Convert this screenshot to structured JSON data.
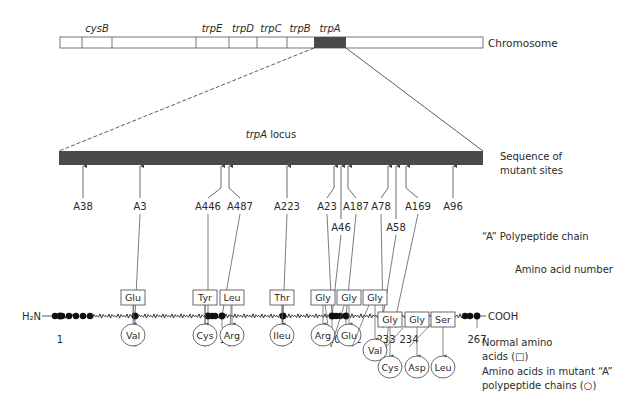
{
  "chromosome": {
    "label": "Chromosome",
    "genes": [
      {
        "name": "cysB",
        "x": 97
      },
      {
        "name": "trpE",
        "x": 212
      },
      {
        "name": "trpD",
        "x": 243
      },
      {
        "name": "trpC",
        "x": 271
      },
      {
        "name": "trpB",
        "x": 300
      },
      {
        "name": "trpA",
        "x": 330
      }
    ],
    "dividers": [
      82,
      112,
      196,
      229,
      257,
      287
    ],
    "bar": {
      "x1": 60,
      "x2": 483,
      "y": 37,
      "h": 11
    },
    "trpA_segment": {
      "x1": 314,
      "x2": 346
    },
    "dark_color": "#4a4a4a"
  },
  "locus": {
    "title_italic": "trpA",
    "title_rest": " locus",
    "bar": {
      "x1": 59,
      "x2": 483,
      "y": 151,
      "h": 14
    }
  },
  "mutant_sites_label": [
    "Sequence of",
    "mutant sites"
  ],
  "mutant_sites": [
    {
      "name": "A38",
      "arrow_x": 83,
      "label_x": 83,
      "label_y": 210,
      "to_chain": null
    },
    {
      "name": "A3",
      "arrow_x": 140,
      "label_x": 140,
      "label_y": 210,
      "to_chain": 48
    },
    {
      "name": "A446",
      "arrow_x": 221,
      "label_x": 208,
      "label_y": 210,
      "to_chain": 174,
      "bent": true
    },
    {
      "name": "A487",
      "arrow_x": 229,
      "label_x": 240,
      "label_y": 210,
      "to_chain": 176,
      "bent": true
    },
    {
      "name": "A223",
      "arrow_x": 287,
      "label_x": 287,
      "label_y": 210,
      "to_chain": 182
    },
    {
      "name": "A23",
      "arrow_x": 334,
      "label_x": 327,
      "label_y": 210,
      "to_chain": 210,
      "bent": true
    },
    {
      "name": "A46",
      "arrow_x": 341,
      "label_x": 341,
      "label_y": 231,
      "to_chain": 210
    },
    {
      "name": "A187",
      "arrow_x": 348,
      "label_x": 356,
      "label_y": 210,
      "to_chain": 212,
      "bent": true
    },
    {
      "name": "A78",
      "arrow_x": 388,
      "label_x": 381,
      "label_y": 210,
      "to_chain": 233,
      "bent": true
    },
    {
      "name": "A58",
      "arrow_x": 396,
      "label_x": 396,
      "label_y": 231,
      "to_chain": 233
    },
    {
      "name": "A169",
      "arrow_x": 406,
      "label_x": 418,
      "label_y": 210,
      "to_chain": 234,
      "bent": true
    },
    {
      "name": "A96",
      "arrow_x": 453,
      "label_x": 453,
      "label_y": 210,
      "to_chain": null
    }
  ],
  "chain": {
    "title": "“A” Polypeptide chain",
    "n_term": "H₂N",
    "c_term": "COOH",
    "y": 316,
    "x1": 55,
    "x2": 478,
    "axis_label": "Amino acid number",
    "positions": [
      {
        "num": "1",
        "x": 60,
        "label_x": 60
      },
      {
        "num": "48",
        "x": 135,
        "label_x": 135
      },
      {
        "num": "174",
        "x": 208,
        "label_x": 205
      },
      {
        "num": "176",
        "x": 222,
        "label_x": 229
      },
      {
        "num": "182",
        "x": 283,
        "label_x": 283
      },
      {
        "num": "210",
        "x": 332,
        "label_x": 331
      },
      {
        "num": "212",
        "x": 346,
        "label_x": 352
      },
      {
        "num": "233",
        "x": 383,
        "label_x": 386
      },
      {
        "num": "234",
        "x": 396,
        "label_x": 409
      },
      {
        "num": "267",
        "x": 477,
        "label_x": 477
      }
    ],
    "extra_dots": [
      55,
      62,
      69,
      76,
      83,
      90,
      212,
      215,
      336,
      340,
      388,
      392,
      440,
      465,
      470
    ],
    "segment_color": "#222222"
  },
  "substitutions": [
    {
      "site": "48",
      "from_x": 135,
      "normal": "Glu",
      "mutant": "Val",
      "box_x": 133,
      "box_y": 363,
      "circle_y": 415,
      "row": 0
    },
    {
      "site": "174",
      "from_x": 205,
      "normal": "Tyr",
      "mutant": "Cys",
      "box_x": 205,
      "box_y": 363,
      "circle_y": 415,
      "row": 0
    },
    {
      "site": "176",
      "from_x": 229,
      "normal": "Leu",
      "mutant": "Arg",
      "box_x": 232,
      "box_y": 363,
      "circle_y": 415,
      "row": 0
    },
    {
      "site": "182",
      "from_x": 283,
      "normal": "Thr",
      "mutant": "Ileu",
      "box_x": 282,
      "box_y": 363,
      "circle_y": 415,
      "row": 0
    },
    {
      "site": "210",
      "from_x": 331,
      "normal": "Gly",
      "mutant": "Arg",
      "box_x": 323,
      "box_y": 363,
      "circle_y": 415,
      "row": 0
    },
    {
      "site": "210",
      "from_x": 331,
      "normal": "Gly",
      "mutant": "Glu",
      "box_x": 349,
      "box_y": 363,
      "circle_y": 415,
      "row": 0
    },
    {
      "site": "212",
      "from_x": 352,
      "normal": "Gly",
      "mutant": "Val",
      "box_x": 375,
      "box_y": 363,
      "circle_y": 430,
      "row": 0
    },
    {
      "site": "233",
      "from_x": 386,
      "normal": "Gly",
      "mutant": "Cys",
      "box_x": 390,
      "box_y": 388,
      "circle_y": 455,
      "row": 1
    },
    {
      "site": "233",
      "from_x": 386,
      "normal": "Gly",
      "mutant": "Asp",
      "box_x": 417,
      "box_y": 388,
      "circle_y": 455,
      "row": 1
    },
    {
      "site": "234",
      "from_x": 409,
      "normal": "Ser",
      "mutant": "Leu",
      "box_x": 443,
      "box_y": 388,
      "circle_y": 455,
      "row": 1
    }
  ],
  "legend": {
    "normal": [
      "Normal amino",
      "acids (□)"
    ],
    "mutant": [
      "Amino acids in mutant “A”",
      "polypeptide chains (○)"
    ]
  }
}
